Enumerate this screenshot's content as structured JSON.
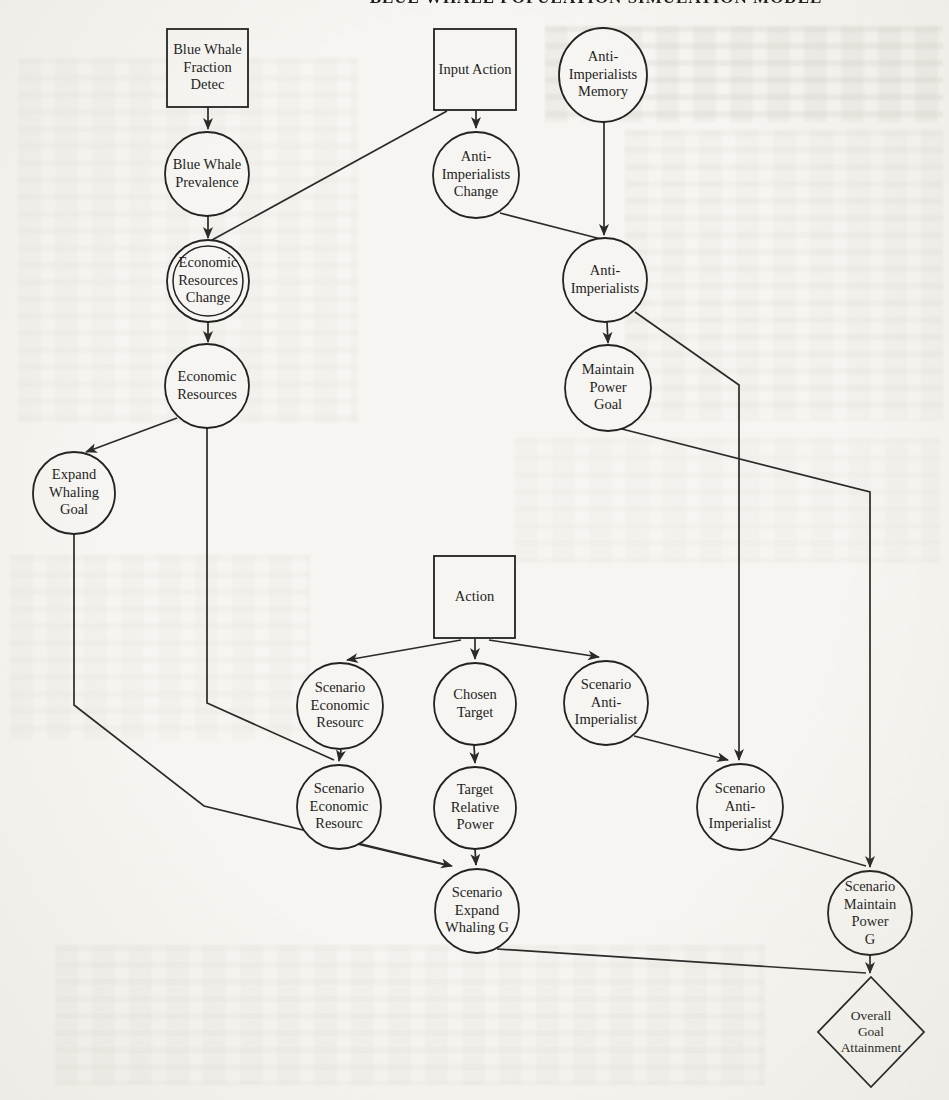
{
  "page": {
    "background_color": "#f6f5f1",
    "ink_color": "#2a2a2a",
    "clipped_header_text": "BLUE WHALE POPULATION SIMULATION MODEL"
  },
  "diagram": {
    "nodes": [
      {
        "id": "blue-whale-fraction-detec",
        "shape": "square",
        "label": "Blue Whale\nFraction\nDetec",
        "x": 167,
        "y": 29,
        "w": 81,
        "h": 78
      },
      {
        "id": "input-action",
        "shape": "square",
        "label": "Input Action",
        "x": 434,
        "y": 29,
        "w": 82,
        "h": 81
      },
      {
        "id": "anti-imperialists-memory",
        "shape": "ellipse",
        "label": "Anti-\nImperialists\nMemory",
        "cx": 603,
        "cy": 75,
        "rx": 44,
        "ry": 47
      },
      {
        "id": "blue-whale-prevalence",
        "shape": "circle",
        "label": "Blue Whale\nPrevalence",
        "cx": 207,
        "cy": 174,
        "r": 42
      },
      {
        "id": "anti-imperialists-change",
        "shape": "circle",
        "label": "Anti-\nImperialists\nChange",
        "cx": 476,
        "cy": 175,
        "r": 43
      },
      {
        "id": "economic-resources-change",
        "shape": "double-circle",
        "label": "Economic\nResources\nChange",
        "cx": 208,
        "cy": 281,
        "r": 41,
        "r2": 35
      },
      {
        "id": "anti-imperialists",
        "shape": "circle",
        "label": "Anti-\nImperialists",
        "cx": 605,
        "cy": 280,
        "r": 42
      },
      {
        "id": "economic-resources",
        "shape": "circle",
        "label": "Economic\nResources",
        "cx": 207,
        "cy": 386,
        "r": 42
      },
      {
        "id": "maintain-power-goal",
        "shape": "circle",
        "label": "Maintain\nPower\nGoal",
        "cx": 608,
        "cy": 388,
        "r": 43
      },
      {
        "id": "expand-whaling-goal",
        "shape": "circle",
        "label": "Expand\nWhaling\nGoal",
        "cx": 74,
        "cy": 493,
        "r": 41
      },
      {
        "id": "action",
        "shape": "square",
        "label": "Action",
        "x": 434,
        "y": 556,
        "w": 81,
        "h": 82
      },
      {
        "id": "scenario-economic-resourc-1",
        "shape": "circle",
        "label": "Scenario\nEconomic\nResourc",
        "cx": 340,
        "cy": 706,
        "r": 43
      },
      {
        "id": "chosen-target",
        "shape": "circle",
        "label": "Chosen\nTarget",
        "cx": 475,
        "cy": 704,
        "r": 41
      },
      {
        "id": "scenario-anti-imperialist-1",
        "shape": "circle",
        "label": "Scenario\nAnti-\nImperialist",
        "cx": 606,
        "cy": 703,
        "r": 42
      },
      {
        "id": "scenario-economic-resourc-2",
        "shape": "circle",
        "label": "Scenario\nEconomic\nResourc",
        "cx": 339,
        "cy": 807,
        "r": 42
      },
      {
        "id": "target-relative-power",
        "shape": "circle",
        "label": "Target\nRelative\nPower",
        "cx": 475,
        "cy": 808,
        "r": 41
      },
      {
        "id": "scenario-anti-imperialist-2",
        "shape": "circle",
        "label": "Scenario\nAnti-\nImperialist",
        "cx": 740,
        "cy": 807,
        "r": 43
      },
      {
        "id": "scenario-expand-whaling-g",
        "shape": "circle",
        "label": "Scenario\nExpand\nWhaling G",
        "cx": 477,
        "cy": 911,
        "r": 42
      },
      {
        "id": "scenario-maintain-power-g",
        "shape": "circle",
        "label": "Scenario\nMaintain\nPower\nG",
        "cx": 870,
        "cy": 913,
        "r": 42
      },
      {
        "id": "overall-goal-attainment",
        "shape": "diamond",
        "label": "Overall\nGoal\nAttainment",
        "cx": 871,
        "cy": 1032,
        "rx": 53,
        "ry": 55
      }
    ],
    "edges": [
      {
        "from": "blue-whale-fraction-detec",
        "to": "blue-whale-prevalence",
        "arrow": true,
        "points": [
          [
            208,
            107
          ],
          [
            208,
            129
          ]
        ]
      },
      {
        "from": "input-action",
        "to": "anti-imperialists-change",
        "arrow": true,
        "points": [
          [
            476,
            110
          ],
          [
            476,
            128
          ]
        ]
      },
      {
        "from": "input-action",
        "to": "economic-resources-change",
        "arrow": false,
        "points": [
          [
            447,
            111
          ],
          [
            212,
            240
          ]
        ]
      },
      {
        "from": "blue-whale-prevalence",
        "to": "economic-resources-change",
        "arrow": true,
        "points": [
          [
            208,
            216
          ],
          [
            208,
            238
          ]
        ]
      },
      {
        "from": "anti-imperialists-memory",
        "to": "anti-imperialists",
        "arrow": true,
        "points": [
          [
            604,
            122
          ],
          [
            604,
            235
          ]
        ]
      },
      {
        "from": "anti-imperialists-change",
        "to": "anti-imperialists",
        "arrow": false,
        "points": [
          [
            500,
            213
          ],
          [
            601,
            239
          ]
        ]
      },
      {
        "from": "economic-resources-change",
        "to": "economic-resources",
        "arrow": true,
        "points": [
          [
            208,
            322
          ],
          [
            208,
            342
          ]
        ]
      },
      {
        "from": "economic-resources",
        "to": "expand-whaling-goal",
        "arrow": true,
        "points": [
          [
            177,
            418
          ],
          [
            86,
            452
          ]
        ]
      },
      {
        "from": "anti-imperialists",
        "to": "maintain-power-goal",
        "arrow": true,
        "points": [
          [
            607,
            322
          ],
          [
            608,
            343
          ]
        ]
      },
      {
        "from": "anti-imperialists",
        "to": "scenario-anti-imperialist-2",
        "arrow": true,
        "points": [
          [
            635,
            312
          ],
          [
            739,
            385
          ],
          [
            739,
            760
          ]
        ]
      },
      {
        "from": "maintain-power-goal",
        "to": "scenario-maintain-power-g",
        "arrow": true,
        "points": [
          [
            618,
            428
          ],
          [
            870,
            492
          ],
          [
            870,
            867
          ]
        ]
      },
      {
        "from": "economic-resources",
        "to": "scenario-economic-resourc-2",
        "arrow": false,
        "points": [
          [
            207,
            428
          ],
          [
            207,
            703
          ],
          [
            334,
            760
          ]
        ]
      },
      {
        "from": "expand-whaling-goal",
        "to": "scenario-expand-whaling-g",
        "arrow": true,
        "points": [
          [
            74,
            534
          ],
          [
            74,
            705
          ],
          [
            204,
            806
          ],
          [
            452,
            866
          ]
        ]
      },
      {
        "from": "action",
        "to": "scenario-economic-resourc-1",
        "arrow": true,
        "points": [
          [
            461,
            640
          ],
          [
            347,
            660
          ]
        ]
      },
      {
        "from": "action",
        "to": "chosen-target",
        "arrow": true,
        "points": [
          [
            475,
            639
          ],
          [
            475,
            659
          ]
        ]
      },
      {
        "from": "action",
        "to": "scenario-anti-imperialist-1",
        "arrow": true,
        "points": [
          [
            489,
            640
          ],
          [
            599,
            657
          ]
        ]
      },
      {
        "from": "scenario-economic-resourc-1",
        "to": "scenario-economic-resourc-2",
        "arrow": true,
        "points": [
          [
            341,
            750
          ],
          [
            339,
            761
          ]
        ]
      },
      {
        "from": "chosen-target",
        "to": "target-relative-power",
        "arrow": true,
        "points": [
          [
            474,
            745
          ],
          [
            475,
            763
          ]
        ]
      },
      {
        "from": "scenario-anti-imperialist-1",
        "to": "scenario-anti-imperialist-2",
        "arrow": true,
        "points": [
          [
            634,
            736
          ],
          [
            728,
            760
          ]
        ]
      },
      {
        "from": "scenario-economic-resourc-2",
        "to": "scenario-expand-whaling-g",
        "arrow": false,
        "points": [
          [
            353,
            843
          ],
          [
            450,
            866
          ]
        ]
      },
      {
        "from": "target-relative-power",
        "to": "scenario-expand-whaling-g",
        "arrow": true,
        "points": [
          [
            475,
            849
          ],
          [
            476,
            865
          ]
        ]
      },
      {
        "from": "scenario-anti-imperialist-2",
        "to": "scenario-maintain-power-g",
        "arrow": false,
        "points": [
          [
            769,
            838
          ],
          [
            866,
            866
          ]
        ]
      },
      {
        "from": "scenario-maintain-power-g",
        "to": "overall-goal-attainment",
        "arrow": true,
        "points": [
          [
            870,
            955
          ],
          [
            870,
            973
          ]
        ]
      },
      {
        "from": "scenario-expand-whaling-g",
        "to": "overall-goal-attainment",
        "arrow": false,
        "points": [
          [
            497,
            949
          ],
          [
            866,
            973
          ]
        ]
      }
    ]
  }
}
